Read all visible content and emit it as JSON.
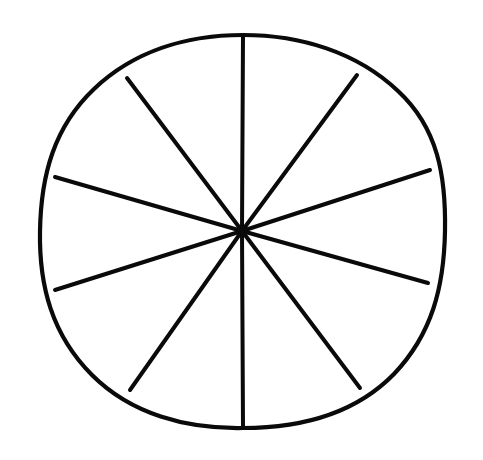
{
  "figure": {
    "title": "Circle divided into ten equal sectors",
    "shape": "circle",
    "background_color": "#ffffff",
    "stroke_color": "#0a0a0a",
    "stroke_width": 4,
    "style": "hand-drawn line art",
    "sector_count": 10,
    "fraction_per_sector": "1/10",
    "filled_sectors": 0,
    "center": {
      "x": 242,
      "y": 231
    },
    "radius_x": 202,
    "radius_y": 196,
    "diameter_count": 5,
    "spoke_angles_deg": [
      90,
      54,
      18,
      342,
      306,
      270,
      234,
      198,
      162,
      126
    ],
    "spoke_endpoints": [
      {
        "label": "top",
        "x": 243,
        "y": 35
      },
      {
        "label": "upper-right",
        "x": 357,
        "y": 75
      },
      {
        "label": "right-upper",
        "x": 430,
        "y": 170
      },
      {
        "label": "right-lower",
        "x": 428,
        "y": 283
      },
      {
        "label": "lower-right",
        "x": 360,
        "y": 388
      },
      {
        "label": "bottom",
        "x": 243,
        "y": 428
      },
      {
        "label": "lower-left",
        "x": 130,
        "y": 390
      },
      {
        "label": "left-lower",
        "x": 55,
        "y": 290
      },
      {
        "label": "left-upper",
        "x": 55,
        "y": 177
      },
      {
        "label": "upper-left",
        "x": 127,
        "y": 78
      }
    ]
  },
  "chart_data": {
    "type": "pie",
    "title": "Circle divided into ten equal sectors",
    "subtitle": "",
    "xlabel": "",
    "ylabel": "",
    "categories": [
      "Sector 1",
      "Sector 2",
      "Sector 3",
      "Sector 4",
      "Sector 5",
      "Sector 6",
      "Sector 7",
      "Sector 8",
      "Sector 9",
      "Sector 10"
    ],
    "values": [
      10,
      10,
      10,
      10,
      10,
      10,
      10,
      10,
      10,
      10
    ],
    "value_unit": "percent",
    "fractions": [
      "1/10",
      "1/10",
      "1/10",
      "1/10",
      "1/10",
      "1/10",
      "1/10",
      "1/10",
      "1/10",
      "1/10"
    ],
    "slice_angle_deg": 36,
    "total": 100,
    "shaded_count": 0,
    "slice_fill_colors": [
      "#ffffff",
      "#ffffff",
      "#ffffff",
      "#ffffff",
      "#ffffff",
      "#ffffff",
      "#ffffff",
      "#ffffff",
      "#ffffff",
      "#ffffff"
    ],
    "outline_color": "#0a0a0a",
    "legend": [],
    "legend_position": "none",
    "grid": false,
    "annotations": [],
    "start_angle_deg": 90,
    "direction": "clockwise"
  }
}
